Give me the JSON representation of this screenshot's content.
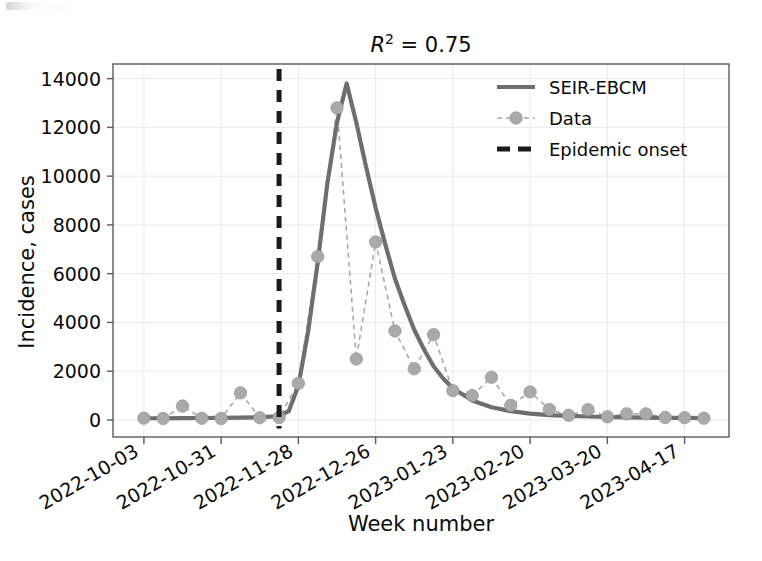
{
  "chart_data": {
    "type": "line",
    "title_parts": {
      "symbol": "R",
      "exponent": "2",
      "equals": " = ",
      "value": "0.75"
    },
    "xlabel": "Week number",
    "ylabel": "Incidence, cases",
    "ylim": [
      -700,
      14600
    ],
    "yticks": [
      0,
      2000,
      4000,
      6000,
      8000,
      10000,
      12000,
      14000
    ],
    "ytick_labels": [
      "0",
      "2000",
      "4000",
      "6000",
      "8000",
      "10000",
      "12000",
      "14000"
    ],
    "xticks": [
      0,
      4,
      8,
      12,
      16,
      20,
      24,
      28
    ],
    "xtick_labels": [
      "2022-10-03",
      "2022-10-31",
      "2022-11-28",
      "2022-12-26",
      "2023-01-23",
      "2023-02-20",
      "2023-03-20",
      "2023-04-17"
    ],
    "xlim": [
      -1.6,
      30.3
    ],
    "grid": true,
    "grid_color": "#e9e9ee",
    "legend_position": "upper right",
    "legend": [
      {
        "label": "SEIR-EBCM",
        "style": "solid-line",
        "color": "#6e6e6e"
      },
      {
        "label": "Data",
        "style": "dashed-line-markers",
        "color": "#a9a9a9"
      },
      {
        "label": "Epidemic onset",
        "style": "dashed-line",
        "color": "#1a1a1a"
      }
    ],
    "annotations": [
      {
        "name": "epidemic-onset",
        "type": "vline",
        "x": 7.0,
        "label": "Epidemic onset",
        "color": "#1a1a1a"
      }
    ],
    "series": [
      {
        "name": "Data",
        "marker": "o",
        "linestyle": "dashed",
        "color": "#a9a9a9",
        "x": [
          0,
          1,
          2,
          3,
          4,
          5,
          6,
          7,
          8,
          9,
          10,
          11,
          12,
          13,
          14,
          15,
          16,
          17,
          18,
          19,
          20,
          21,
          22,
          23,
          24,
          25,
          26,
          27,
          28,
          29
        ],
        "values": [
          70,
          60,
          570,
          70,
          60,
          1110,
          90,
          100,
          1500,
          6700,
          12800,
          2500,
          7300,
          3650,
          2100,
          3500,
          1200,
          1000,
          1750,
          600,
          1150,
          430,
          190,
          420,
          130,
          250,
          250,
          100,
          90,
          70
        ]
      },
      {
        "name": "SEIR-EBCM",
        "marker": "none",
        "linestyle": "solid",
        "color": "#6e6e6e",
        "x": [
          0,
          1,
          2,
          3,
          4,
          5,
          6,
          7,
          7.5,
          8,
          8.5,
          9,
          9.5,
          10,
          10.5,
          11,
          11.5,
          12,
          12.5,
          13,
          13.5,
          14,
          14.5,
          15,
          15.5,
          16,
          17,
          18,
          19,
          20,
          21,
          22,
          23,
          24,
          25,
          26,
          27,
          28,
          29
        ],
        "values": [
          70,
          70,
          75,
          80,
          85,
          95,
          110,
          160,
          360,
          1400,
          3600,
          6450,
          9700,
          12200,
          13800,
          12200,
          10400,
          8700,
          7200,
          5800,
          4700,
          3700,
          2900,
          2200,
          1700,
          1300,
          800,
          520,
          360,
          260,
          200,
          165,
          140,
          120,
          105,
          95,
          88,
          82,
          78
        ]
      }
    ]
  }
}
